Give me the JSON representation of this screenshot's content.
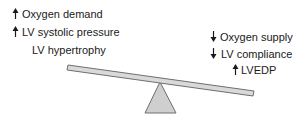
{
  "left_side": {
    "items": [
      {
        "direction": "up",
        "text": "Oxygen demand"
      },
      {
        "direction": "up",
        "text": "LV systolic pressure"
      },
      {
        "direction": "none",
        "text": "LV hypertrophy"
      }
    ]
  },
  "right_side": {
    "items": [
      {
        "direction": "down",
        "text": "Oxygen supply"
      },
      {
        "direction": "down",
        "text": "LV compliance"
      },
      {
        "direction": "up",
        "text": "LVEDP"
      }
    ]
  },
  "colors": {
    "text": "#1a1a1a",
    "plank_fill": "#d9d9d9",
    "plank_stroke": "#6e6e6e",
    "fulcrum_fill": "#cfcfcf",
    "fulcrum_stroke": "#6e6e6e"
  }
}
